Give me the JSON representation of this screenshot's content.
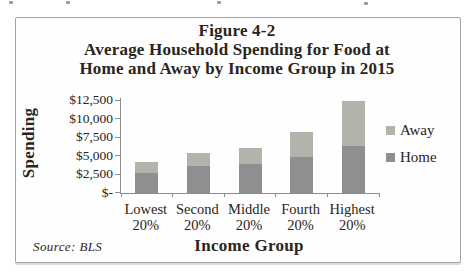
{
  "figure": {
    "title_lines": [
      "Figure 4-2",
      "Average Household Spending for Food at",
      "Home and Away by Income Group in 2015"
    ]
  },
  "chart_data": {
    "type": "bar",
    "stacked": true,
    "title": "Figure 4-2",
    "subtitle": "Average Household Spending for Food at Home and Away by Income Group in 2015",
    "categories": [
      {
        "line1": "Lowest",
        "line2": "20%"
      },
      {
        "line1": "Second",
        "line2": "20%"
      },
      {
        "line1": "Middle",
        "line2": "20%"
      },
      {
        "line1": "Fourth",
        "line2": "20%"
      },
      {
        "line1": "Highest",
        "line2": "20%"
      }
    ],
    "series": [
      {
        "name": "Home",
        "values": [
          2700,
          3600,
          3900,
          4800,
          6300
        ],
        "color": "#8d8f90"
      },
      {
        "name": "Away",
        "values": [
          1400,
          1700,
          2100,
          3400,
          6100
        ],
        "color": "#b2b3ab"
      }
    ],
    "xlabel": "Income Group",
    "ylabel": "Spending",
    "ylim": [
      0,
      12500
    ],
    "grid": false,
    "y_ticks": [
      {
        "value": 12500,
        "label": "$12,500"
      },
      {
        "value": 10000,
        "label": "$10,000"
      },
      {
        "value": 7500,
        "label": "$7,500"
      },
      {
        "value": 5000,
        "label": "$5,000"
      },
      {
        "value": 2500,
        "label": "$2,500"
      },
      {
        "value": 0,
        "label": "$-"
      }
    ],
    "legend_items": [
      {
        "label": "Away",
        "color": "#b2b3ab"
      },
      {
        "label": "Home",
        "color": "#8d8f90"
      }
    ],
    "legend_position": "right",
    "source": "Source:  BLS",
    "colors": {
      "axis": "#8c8c8c",
      "text": "#2a2520",
      "frame_border": "#a5a3a0"
    }
  }
}
